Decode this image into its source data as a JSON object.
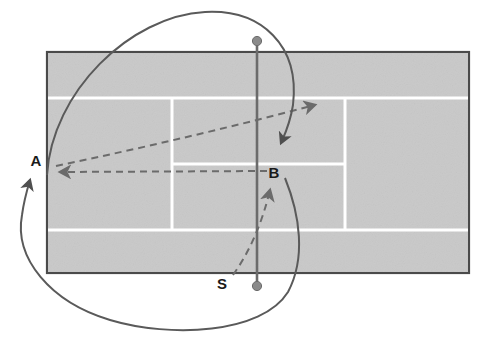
{
  "figure": {
    "type": "tennis-court-tactics-diagram",
    "background_color": "#ffffff",
    "court": {
      "surface_color": "#c9c9c9",
      "line_color": "#ffffff",
      "border_color": "#4a4a4a",
      "x": 47,
      "y": 52,
      "width": 422,
      "height": 221
    },
    "net": {
      "color": "#6b6b6b",
      "post_color": "#8a8a8a",
      "x": 257,
      "top_y": 41,
      "bottom_y": 286
    },
    "labels": [
      {
        "id": "label-a",
        "text": "A",
        "x": 36,
        "y": 166
      },
      {
        "id": "label-b",
        "text": "B",
        "x": 274,
        "y": 178
      },
      {
        "id": "label-s",
        "text": "S",
        "x": 222,
        "y": 289
      }
    ],
    "ball_paths": {
      "style": "dashed",
      "color": "#6b6b6b",
      "items": [
        {
          "id": "shot-b-to-a",
          "from": "B",
          "to": "A",
          "description": "dashed arrow from B leftward to A"
        },
        {
          "id": "shot-a-to-deep-crosscourt",
          "from": "A",
          "to": "deep-corner",
          "description": "dashed arrow from A rising to the far service-box corner"
        },
        {
          "id": "shot-s-to-b",
          "from": "S",
          "to": "B",
          "description": "dashed arrow curving up from S to B"
        }
      ]
    },
    "player_paths": {
      "style": "solid",
      "color": "#5a5a5a",
      "items": [
        {
          "id": "run-top-to-b",
          "description": "solid curve sweeping from upper left over the net post and down to B"
        },
        {
          "id": "run-loop-to-a",
          "description": "solid loop passing under the court and arriving upward at A"
        }
      ]
    }
  }
}
